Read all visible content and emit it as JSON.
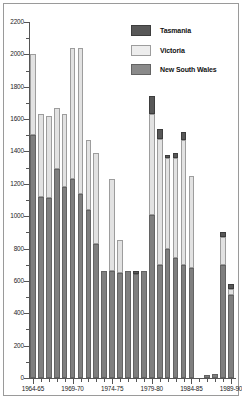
{
  "chart_data": {
    "type": "bar",
    "subtype": "stacked-bar",
    "title": "",
    "xlabel": "",
    "ylabel": "",
    "ylim": [
      0,
      2200
    ],
    "y_major_step": 200,
    "y_minor_step": 100,
    "grid": false,
    "legend_position": "top-right",
    "y_ticks": [
      "2200",
      "2000",
      "1800",
      "1600",
      "1400",
      "1200",
      "1000",
      "800",
      "600",
      "400",
      "200",
      "0"
    ],
    "x_tick_labels": [
      "1964-65",
      "1969-70",
      "1974-75",
      "1979-80",
      "1984-85",
      "1989-90"
    ],
    "x_tick_label_indices": [
      0,
      5,
      10,
      15,
      20,
      25
    ],
    "categories": [
      "1964-65",
      "1965-66",
      "1966-67",
      "1967-68",
      "1968-69",
      "1969-70",
      "1970-71",
      "1971-72",
      "1972-73",
      "1973-74",
      "1974-75",
      "1975-76",
      "1976-77",
      "1977-78",
      "1978-79",
      "1979-80",
      "1980-81",
      "1981-82",
      "1982-83",
      "1983-84",
      "1984-85",
      "1985-86",
      "1986-87",
      "1987-88",
      "1988-89",
      "1989-90"
    ],
    "series": [
      {
        "name": "New South Wales",
        "color": "#7f7f7f",
        "values": [
          1500,
          1120,
          1110,
          1290,
          1180,
          1230,
          1140,
          1040,
          830,
          660,
          660,
          650,
          660,
          640,
          660,
          1010,
          700,
          800,
          740,
          700,
          680,
          0,
          20,
          25,
          700,
          510
        ]
      },
      {
        "name": "Victoria",
        "color": "#e2e2e2",
        "values": [
          500,
          510,
          510,
          380,
          450,
          810,
          900,
          430,
          560,
          0,
          570,
          200,
          0,
          0,
          0,
          620,
          780,
          560,
          620,
          770,
          570,
          0,
          0,
          0,
          170,
          40
        ]
      },
      {
        "name": "Tasmania",
        "color": "#585858",
        "values": [
          0,
          0,
          0,
          0,
          0,
          0,
          0,
          0,
          0,
          0,
          0,
          0,
          0,
          20,
          0,
          110,
          60,
          20,
          30,
          50,
          0,
          0,
          0,
          0,
          30,
          30
        ]
      }
    ],
    "totals": [
      2000,
      1630,
      1620,
      1670,
      1630,
      2040,
      2040,
      1470,
      1390,
      660,
      1230,
      850,
      660,
      660,
      660,
      1740,
      1540,
      1380,
      1390,
      1520,
      1250,
      0,
      20,
      25,
      900,
      580
    ]
  },
  "legend": {
    "items": [
      {
        "label": "Tasmania",
        "swatch": "tas"
      },
      {
        "label": "Victoria",
        "swatch": "vic"
      },
      {
        "label": "New South Wales",
        "swatch": "nsw"
      }
    ]
  }
}
